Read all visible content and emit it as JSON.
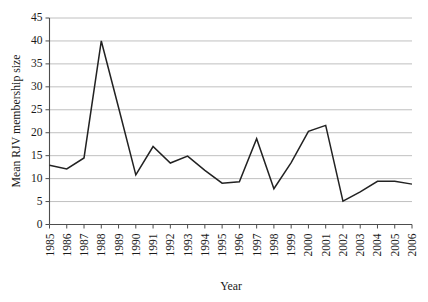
{
  "chart_data": {
    "type": "line",
    "title": "",
    "xlabel": "Year",
    "ylabel": "Mean RJV membership size",
    "categories": [
      "1985",
      "1986",
      "1987",
      "1988",
      "1989",
      "1990",
      "1991",
      "1992",
      "1993",
      "1994",
      "1995",
      "1996",
      "1997",
      "1998",
      "1999",
      "2000",
      "2001",
      "2002",
      "2003",
      "2004",
      "2005",
      "2006"
    ],
    "values": [
      12.9,
      12.1,
      14.5,
      40.0,
      25.5,
      10.8,
      17.0,
      13.4,
      14.9,
      11.8,
      9.0,
      9.3,
      18.7,
      7.8,
      13.5,
      20.3,
      21.6,
      5.1,
      7.1,
      9.4,
      9.4,
      8.8
    ],
    "series": [
      {
        "name": "Mean RJV membership size",
        "values": [
          12.9,
          12.1,
          14.5,
          40.0,
          25.5,
          10.8,
          17.0,
          13.4,
          14.9,
          11.8,
          9.0,
          9.3,
          18.7,
          7.8,
          13.5,
          20.3,
          21.6,
          5.1,
          7.1,
          9.4,
          9.4,
          8.8
        ]
      }
    ],
    "xlim": [
      1985,
      2006
    ],
    "ylim": [
      0,
      45
    ],
    "yticks": [
      0,
      5,
      10,
      15,
      20,
      25,
      30,
      35,
      40,
      45
    ],
    "ytick_labels": [
      "0",
      "5",
      "10",
      "15",
      "20",
      "25",
      "30",
      "35",
      "40",
      "45"
    ],
    "xtick_labels": [
      "1985",
      "1986",
      "1987",
      "1988",
      "1989",
      "1990",
      "1991",
      "1992",
      "1993",
      "1994",
      "1995",
      "1996",
      "1997",
      "1998",
      "1999",
      "2000",
      "2001",
      "2002",
      "2003",
      "2004",
      "2005",
      "2006"
    ],
    "grid": "horizontal",
    "legend": "none",
    "annotations": [],
    "line_color": "#222222",
    "grid_color": "#b9b9b9",
    "axis_color": "#4d4d4d"
  },
  "caption": {
    "partial_text": ""
  }
}
